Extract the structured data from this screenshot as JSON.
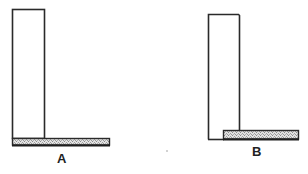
{
  "diagram": {
    "colors": {
      "stroke": "#2a2a2a",
      "background": "#ffffff",
      "base_fill": "#d9d9d9",
      "stipple": "#9a9a9a"
    },
    "panels": [
      {
        "id": "A",
        "label": "A",
        "upright": {
          "x": 12,
          "y": 9,
          "width": 32,
          "height": 129
        },
        "base": {
          "x": 12,
          "y": 138,
          "width": 98,
          "height": 7
        },
        "arrangement": "upright rests on top of base plate"
      },
      {
        "id": "B",
        "label": "B",
        "upright": {
          "x": 208,
          "y": 14,
          "width": 31,
          "height": 125
        },
        "base": {
          "x": 223,
          "y": 130,
          "width": 76,
          "height": 9
        },
        "arrangement": "base plate butts against the side of the upright"
      }
    ],
    "speck": {
      "x": 167,
      "y": 151
    }
  }
}
